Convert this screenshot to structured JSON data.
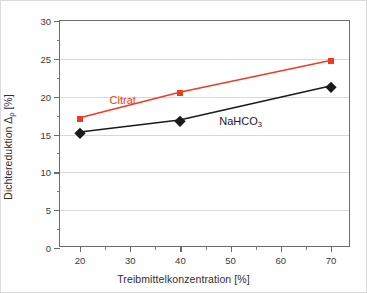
{
  "chart_data": {
    "type": "line",
    "title": "",
    "xlabel": "Treibmittelkonzentration [%]",
    "ylabel": "Dichtereduktion Δρ [%]",
    "ylabel_main": "Dichtereduktion Δ",
    "ylabel_rho": "ρ",
    "ylabel_unit": " [%]",
    "xlim": [
      16,
      74
    ],
    "ylim": [
      0,
      30
    ],
    "xticks": [
      20,
      30,
      40,
      50,
      60,
      70
    ],
    "xtick_labels": [
      "20",
      "30",
      "40",
      "50",
      "60",
      "70"
    ],
    "yticks": [
      0,
      5,
      10,
      15,
      20,
      25,
      30
    ],
    "ytick_labels": [
      "0",
      "5",
      "10",
      "15",
      "20",
      "25",
      "30"
    ],
    "y_minor_ticks": [
      2.5,
      7.5,
      12.5,
      17.5,
      22.5,
      27.5
    ],
    "x_minor_ticks": [
      25,
      35,
      45,
      55,
      65
    ],
    "grid": "horizontal-major",
    "grid_color": "#d9d9d9",
    "legend_position": "inline-annotations",
    "series": [
      {
        "name": "Citrat",
        "color": "#ee3b22",
        "marker": "square",
        "x": [
          20,
          40,
          70
        ],
        "values": [
          17.1,
          20.5,
          24.7
        ],
        "label_x": 28.5,
        "label_y": 19.6
      },
      {
        "name": "NaHCO3",
        "name_main": "NaHCO",
        "name_sub": "3",
        "color": "#1a1a1a",
        "marker": "diamond",
        "x": [
          20,
          40,
          70
        ],
        "values": [
          15.2,
          16.8,
          21.3
        ],
        "label_x": 52.0,
        "label_y": 16.6
      }
    ]
  }
}
